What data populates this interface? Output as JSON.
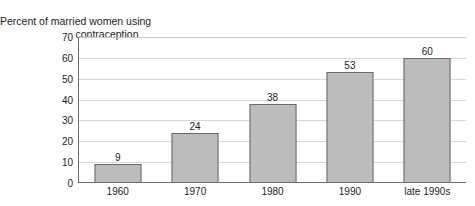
{
  "chart_data": {
    "type": "bar",
    "title": "Percent of married women using contraception",
    "title_line1": "Percent of married women using",
    "title_line2": "contraception",
    "xlabel": "",
    "ylabel": "",
    "categories": [
      "1960",
      "1970",
      "1980",
      "1990",
      "late 1990s"
    ],
    "values": [
      9,
      24,
      38,
      53,
      60
    ],
    "value_labels": [
      "9",
      "24",
      "38",
      "53",
      "60"
    ],
    "ylim": [
      0,
      70
    ],
    "ytick_step": 10,
    "yticks": [
      0,
      10,
      20,
      30,
      40,
      50,
      60,
      70
    ],
    "ytick_labels": [
      "0",
      "10",
      "20",
      "30",
      "40",
      "50",
      "60",
      "70"
    ],
    "grid": true,
    "legend": null,
    "series": [
      {
        "name": "Percent of married women using contraception",
        "values": [
          9,
          24,
          38,
          53,
          60
        ]
      }
    ],
    "colors": {
      "bar_fill": "#bcbcbc",
      "bar_border": "#6a6a6a",
      "gridline": "#d7d7d7",
      "axis": "#6d6d6d",
      "text": "#1c1c1c",
      "background": "#ffffff"
    }
  }
}
